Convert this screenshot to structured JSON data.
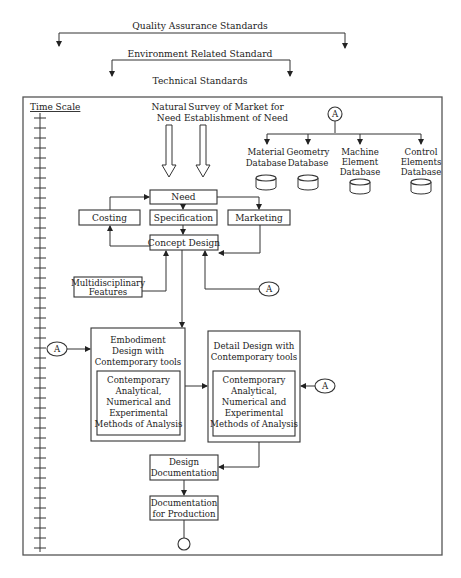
{
  "standards": {
    "quality": "Quality Assurance Standards",
    "environment": "Environment Related Standard",
    "technical": "Technical Standards"
  },
  "time_scale": {
    "label": "Time Scale",
    "tick_count": 44
  },
  "inputs": {
    "natural_need": [
      "Natural",
      "Need"
    ],
    "market_survey": [
      "Survey of Market for",
      "Establishment of Need"
    ]
  },
  "connector_label": "A",
  "databases": [
    {
      "lines": [
        "Material",
        "Database"
      ]
    },
    {
      "lines": [
        "Geometry",
        "Database"
      ]
    },
    {
      "lines": [
        "Machine",
        "Element",
        "Database"
      ]
    },
    {
      "lines": [
        "Control",
        "Elements",
        "Database"
      ]
    }
  ],
  "nodes": {
    "need": "Need",
    "costing": "Costing",
    "specification": "Specification",
    "marketing": "Marketing",
    "concept_design": "Concept Design",
    "multidisciplinary": [
      "Multidisciplinary",
      "Features"
    ],
    "embodiment": [
      "Embodiment",
      "Design with",
      "Contemporary tools"
    ],
    "detail": [
      "Detail Design with",
      "Contemporary tools"
    ],
    "methods": [
      "Contemporary",
      "Analytical,",
      "Numerical and",
      "Experimental",
      "Methods of Analysis"
    ],
    "design_documentation": [
      "Design",
      "Documentation"
    ],
    "documentation_production": [
      "Documentation",
      "for Production"
    ]
  },
  "colors": {
    "line": "#333333",
    "frame": "#555555",
    "background": "#ffffff"
  }
}
